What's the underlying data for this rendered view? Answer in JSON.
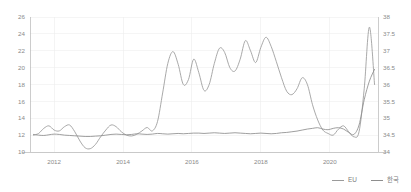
{
  "chart_data": {
    "type": "line",
    "title": "",
    "subtitle": "",
    "xlabel": "",
    "ylabel": "",
    "grid": true,
    "legend_position": "bottom-right",
    "x_tick_labels": [
      "2012",
      "2014",
      "2016",
      "2018",
      "2020"
    ],
    "x_tick_values": [
      2012,
      2014,
      2016,
      2018,
      2020
    ],
    "xlim": [
      2011.3,
      2021.4
    ],
    "axes": [
      {
        "id": "left",
        "side": "left",
        "series": "EU",
        "ylim": [
          10,
          26
        ],
        "ticks": [
          10,
          12,
          14,
          16,
          18,
          20,
          22,
          24,
          26
        ],
        "tick_labels": [
          "10",
          "12",
          "14",
          "16",
          "18",
          "20",
          "22",
          "24",
          "26"
        ]
      },
      {
        "id": "right",
        "side": "right",
        "series": "한국",
        "ylim": [
          34,
          38
        ],
        "ticks": [
          34,
          34.5,
          35,
          35.5,
          36,
          36.5,
          37,
          37.5,
          38
        ],
        "tick_labels": [
          "34",
          "34.5",
          "35",
          "35.5",
          "36",
          "36.5",
          "37",
          "37.5",
          "38"
        ]
      }
    ],
    "series": [
      {
        "name": "EU",
        "axis": "left",
        "color": "#9a9a9a",
        "x": [
          2011.4,
          2011.55,
          2011.7,
          2011.85,
          2012.0,
          2012.15,
          2012.3,
          2012.45,
          2012.6,
          2012.75,
          2012.9,
          2013.05,
          2013.2,
          2013.35,
          2013.5,
          2013.65,
          2013.8,
          2013.95,
          2014.1,
          2014.25,
          2014.4,
          2014.55,
          2014.7,
          2014.85,
          2015.0,
          2015.15,
          2015.3,
          2015.45,
          2015.6,
          2015.75,
          2015.9,
          2016.05,
          2016.2,
          2016.35,
          2016.5,
          2016.65,
          2016.8,
          2016.95,
          2017.1,
          2017.25,
          2017.4,
          2017.55,
          2017.7,
          2017.85,
          2018.0,
          2018.15,
          2018.3,
          2018.45,
          2018.6,
          2018.75,
          2018.9,
          2019.05,
          2019.2,
          2019.35,
          2019.5,
          2019.65,
          2019.8,
          2019.95,
          2020.1,
          2020.25,
          2020.4,
          2020.55,
          2020.7,
          2020.85,
          2021.0,
          2021.15,
          2021.3
        ],
        "values": [
          12.0,
          12.2,
          12.8,
          13.1,
          12.6,
          12.5,
          13.0,
          13.2,
          12.4,
          11.3,
          10.5,
          10.4,
          10.9,
          11.8,
          12.6,
          13.2,
          13.0,
          12.4,
          12.0,
          11.9,
          12.1,
          12.5,
          12.9,
          12.5,
          13.6,
          17.0,
          20.5,
          21.9,
          20.4,
          18.0,
          18.6,
          21.0,
          19.4,
          17.3,
          18.0,
          20.5,
          22.3,
          21.8,
          20.0,
          19.6,
          21.0,
          23.2,
          22.0,
          20.6,
          22.4,
          23.6,
          22.5,
          20.7,
          18.8,
          17.2,
          16.8,
          17.5,
          18.8,
          18.0,
          15.6,
          13.8,
          12.6,
          12.2,
          12.0,
          12.7,
          13.1,
          12.4,
          11.8,
          12.4,
          17.5,
          24.8,
          18.0
        ]
      },
      {
        "name": "한국",
        "axis": "right",
        "color": "#8e8e8e",
        "x": [
          2011.4,
          2011.55,
          2011.7,
          2011.85,
          2012.0,
          2012.15,
          2012.3,
          2012.45,
          2012.6,
          2012.75,
          2012.9,
          2013.05,
          2013.2,
          2013.35,
          2013.5,
          2013.65,
          2013.8,
          2013.95,
          2014.1,
          2014.25,
          2014.4,
          2014.55,
          2014.7,
          2014.85,
          2015.0,
          2015.15,
          2015.3,
          2015.45,
          2015.6,
          2015.75,
          2015.9,
          2016.05,
          2016.2,
          2016.35,
          2016.5,
          2016.65,
          2016.8,
          2016.95,
          2017.1,
          2017.25,
          2017.4,
          2017.55,
          2017.7,
          2017.85,
          2018.0,
          2018.15,
          2018.3,
          2018.45,
          2018.6,
          2018.75,
          2018.9,
          2019.05,
          2019.2,
          2019.35,
          2019.5,
          2019.65,
          2019.8,
          2019.95,
          2020.1,
          2020.25,
          2020.4,
          2020.55,
          2020.7,
          2020.85,
          2021.0,
          2021.15,
          2021.3
        ],
        "values": [
          34.52,
          34.5,
          34.49,
          34.51,
          34.53,
          34.52,
          34.5,
          34.49,
          34.48,
          34.47,
          34.46,
          34.46,
          34.47,
          34.48,
          34.5,
          34.52,
          34.53,
          34.52,
          34.51,
          34.52,
          34.54,
          34.53,
          34.52,
          34.53,
          34.55,
          34.54,
          34.53,
          34.54,
          34.55,
          34.54,
          34.55,
          34.56,
          34.56,
          34.55,
          34.56,
          34.57,
          34.56,
          34.55,
          34.56,
          34.57,
          34.56,
          34.55,
          34.54,
          34.55,
          34.56,
          34.55,
          34.54,
          34.55,
          34.57,
          34.58,
          34.6,
          34.62,
          34.65,
          34.68,
          34.7,
          34.72,
          34.68,
          34.66,
          34.7,
          34.72,
          34.68,
          34.58,
          34.52,
          34.8,
          35.55,
          36.1,
          36.45
        ]
      }
    ]
  },
  "legend": {
    "items": [
      {
        "label": "EU",
        "color": "#9a9a9a"
      },
      {
        "label": "한국",
        "color": "#8e8e8e"
      }
    ]
  }
}
